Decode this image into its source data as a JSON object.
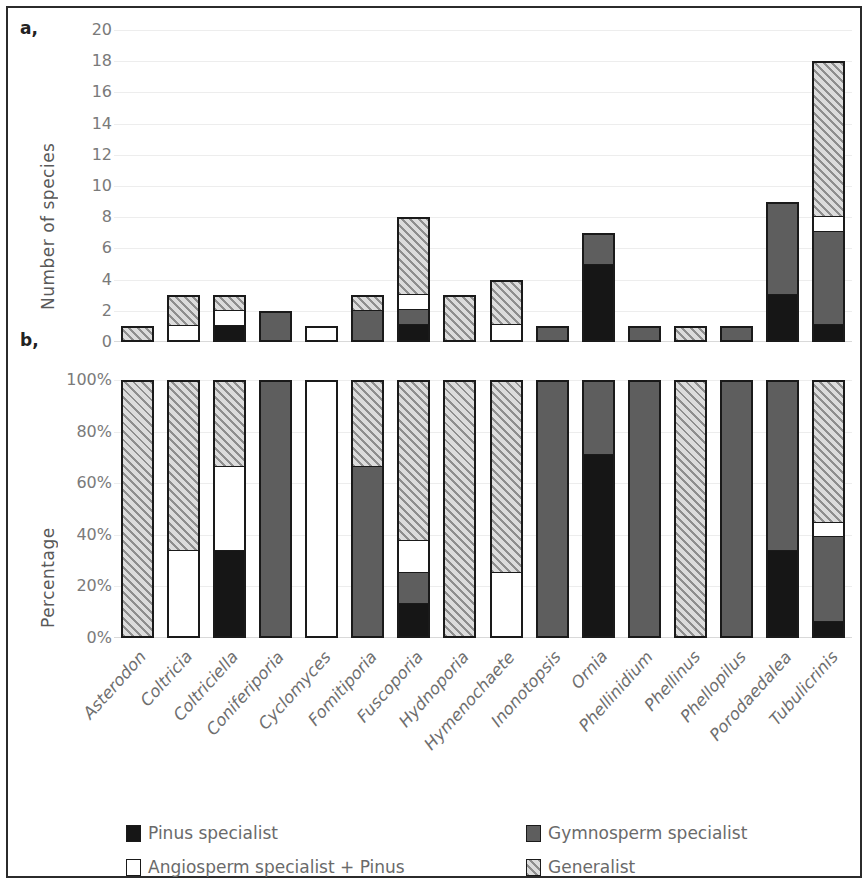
{
  "panels": {
    "a": {
      "tag": "a,",
      "ylabel": "Number of species",
      "yticks": [
        "20",
        "18",
        "16",
        "14",
        "12",
        "10",
        "8",
        "6",
        "4",
        "2",
        "0"
      ]
    },
    "b": {
      "tag": "b,",
      "ylabel": "Percentage",
      "yticks": [
        "100%",
        "80%",
        "60%",
        "40%",
        "20%",
        "0%"
      ]
    }
  },
  "legend": {
    "items": [
      {
        "label": "Pinus specialist",
        "key": "pinus",
        "color": "#161616"
      },
      {
        "label": "Gymnosperm specialist",
        "key": "gymnosperm",
        "color": "#5e5e5e"
      },
      {
        "label": "Angiosperm specialist + Pinus",
        "key": "angiosperm",
        "color": "#ffffff"
      },
      {
        "label": "Generalist",
        "key": "generalist",
        "color": "#c9c9c9"
      }
    ]
  },
  "chart_data": {
    "type": "bar",
    "title": "",
    "subtitle": "",
    "layout": "two stacked-bar panels sharing one categorical x axis",
    "categories": [
      "Asterodon",
      "Coltricia",
      "Coltriciella",
      "Coniferiporia",
      "Cyclomyces",
      "Fomitiporia",
      "Fuscoporia",
      "Hydnoporia",
      "Hymenochaete",
      "Inonotopsis",
      "Ornia",
      "Phellinidium",
      "Phellinus",
      "Phellopilus",
      "Porodaedalea",
      "Tubulicrinis"
    ],
    "series": [
      {
        "name": "Pinus specialist",
        "key": "pinus",
        "color": "#161616",
        "counts": [
          0,
          0,
          1,
          0,
          0,
          0,
          1,
          0,
          0,
          0,
          5,
          0,
          0,
          0,
          3,
          1
        ],
        "percent": [
          0,
          0,
          33.3,
          0,
          0,
          0,
          12.5,
          0,
          0,
          0,
          71.4,
          0,
          0,
          0,
          33.3,
          5.6
        ]
      },
      {
        "name": "Gymnosperm specialist",
        "key": "gymnosperm",
        "color": "#5e5e5e",
        "counts": [
          0,
          0,
          0,
          2,
          0,
          2,
          1,
          0,
          0,
          1,
          2,
          1,
          0,
          1,
          6,
          6
        ],
        "percent": [
          0,
          0,
          0,
          100,
          0,
          66.7,
          12.5,
          0,
          0,
          100,
          28.6,
          100,
          0,
          100,
          66.7,
          33.3
        ]
      },
      {
        "name": "Angiosperm specialist + Pinus",
        "key": "angiosperm",
        "color": "#ffffff",
        "counts": [
          0,
          1,
          1,
          0,
          1,
          0,
          1,
          0,
          1,
          0,
          0,
          0,
          0,
          0,
          0,
          1
        ],
        "percent": [
          0,
          33.3,
          33.3,
          0,
          100,
          0,
          12.5,
          0,
          25,
          0,
          0,
          0,
          0,
          0,
          0,
          5.6
        ]
      },
      {
        "name": "Generalist",
        "key": "generalist",
        "color": "#c9c9c9",
        "counts": [
          1,
          2,
          1,
          0,
          0,
          1,
          5,
          3,
          3,
          0,
          0,
          0,
          1,
          0,
          0,
          10
        ],
        "percent": [
          100,
          66.7,
          33.3,
          0,
          0,
          33.3,
          62.5,
          100,
          75,
          0,
          0,
          0,
          100,
          0,
          0,
          55.6
        ]
      }
    ],
    "totals": [
      1,
      3,
      3,
      2,
      1,
      3,
      8,
      3,
      4,
      1,
      7,
      1,
      1,
      1,
      9,
      18
    ],
    "panel_a": {
      "ylabel": "Number of species",
      "ylim": [
        0,
        20
      ],
      "ytick_step": 2,
      "grid": true
    },
    "panel_b": {
      "ylabel": "Percentage",
      "ylim": [
        0,
        100
      ],
      "ytick_step": 20,
      "grid": true
    },
    "xlabel": "",
    "legend_position": "bottom"
  }
}
